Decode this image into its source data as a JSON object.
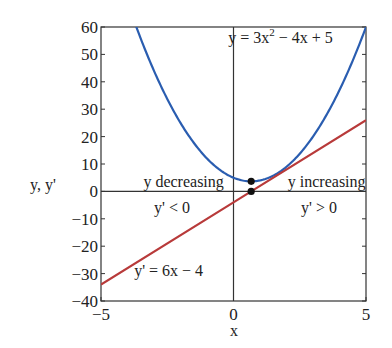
{
  "chart_data": {
    "type": "line",
    "title": "",
    "xlabel": "x",
    "ylabel": "y, y'",
    "xlim": [
      -5,
      5
    ],
    "ylim": [
      -40,
      60
    ],
    "grid": false,
    "x_ticks": [
      -5,
      0,
      5
    ],
    "x_tick_labels": [
      "−5",
      "0",
      "5"
    ],
    "y_ticks": [
      60,
      50,
      40,
      30,
      20,
      10,
      0,
      -10,
      -20,
      -30,
      -40
    ],
    "y_tick_labels": [
      "60",
      "50",
      "40",
      "30",
      "20",
      "10",
      "0",
      "−10",
      "−20",
      "−30",
      "−40"
    ],
    "series": [
      {
        "name": "y = 3x² − 4x + 5",
        "formula": {
          "a": 3,
          "b": -4,
          "c": 5
        },
        "color": "#2a5db0",
        "x": [
          -3.5,
          -3,
          -2.5,
          -2,
          -1.5,
          -1,
          -0.5,
          0,
          0.5,
          0.667,
          1,
          1.5,
          2,
          2.5,
          3,
          3.5,
          4,
          4.5,
          5
        ],
        "values": [
          55.75,
          44,
          33.75,
          25,
          17.75,
          12,
          8.75,
          5,
          3.75,
          3.67,
          4,
          5.75,
          9,
          13.75,
          20,
          27.75,
          37,
          47.75,
          60
        ]
      },
      {
        "name": "y' = 6x − 4",
        "formula": {
          "m": 6,
          "b": -4
        },
        "color": "#b83a3a",
        "x": [
          -5,
          0,
          0.667,
          5
        ],
        "values": [
          -34,
          -4,
          0,
          26
        ]
      }
    ],
    "points": [
      {
        "x": 0.667,
        "y": 3.67,
        "label": "minimum of y"
      },
      {
        "x": 0.667,
        "y": 0,
        "label": "zero of y'"
      }
    ],
    "annotations": [
      {
        "text_main": "y = 3x",
        "sup": "2",
        "text_rest": " − 4x + 5",
        "x": -0.2,
        "y": 54
      },
      {
        "text": "y decreasing",
        "x": -3.4,
        "y": 1.5
      },
      {
        "text": "y' < 0",
        "x": -3.0,
        "y": -8
      },
      {
        "text": "y increasing",
        "x": 2.05,
        "y": 1.5
      },
      {
        "text": "y' > 0",
        "x": 2.55,
        "y": -8
      },
      {
        "text": "y' = 6x − 4",
        "x": -3.75,
        "y": -31
      }
    ]
  },
  "labels": {
    "xlabel": "x",
    "ylabel": "y, y'"
  }
}
